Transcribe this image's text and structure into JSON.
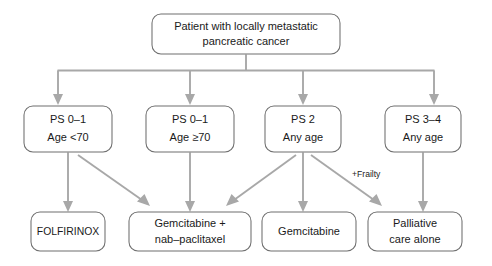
{
  "figure": {
    "type": "flowchart",
    "orientation": "top-down",
    "background_color": "#ffffff",
    "box_border_color": "#6f6f6f",
    "connector_color": "#a8a8a8",
    "text_color": "#1a1a1a"
  },
  "root": {
    "id": "root-node",
    "line1": "Patient with locally metastatic",
    "line2": "pancreatic cancer"
  },
  "branches": [
    {
      "id": "ps01-under70",
      "line1": "PS 0–1",
      "line2": "Age <70"
    },
    {
      "id": "ps01-over70",
      "line1": "PS 0–1",
      "line2": "Age ≥70"
    },
    {
      "id": "ps2-any-age",
      "line1": "PS 2",
      "line2": "Any age"
    },
    {
      "id": "ps34-any-age",
      "line1": "PS 3–4",
      "line2": "Any age"
    }
  ],
  "treatments": [
    {
      "id": "folfirinox",
      "line1": "FOLFIRINOX",
      "line2": ""
    },
    {
      "id": "gem-nab-paclitaxel",
      "line1": "Gemcitabine +",
      "line2": "nab–paclitaxel"
    },
    {
      "id": "gemcitabine",
      "line1": "Gemcitabine",
      "line2": ""
    },
    {
      "id": "palliative-care",
      "line1": "Palliative",
      "line2": "care alone"
    }
  ],
  "annotations": [
    {
      "id": "frailty-label",
      "text": "+Frailty"
    }
  ]
}
